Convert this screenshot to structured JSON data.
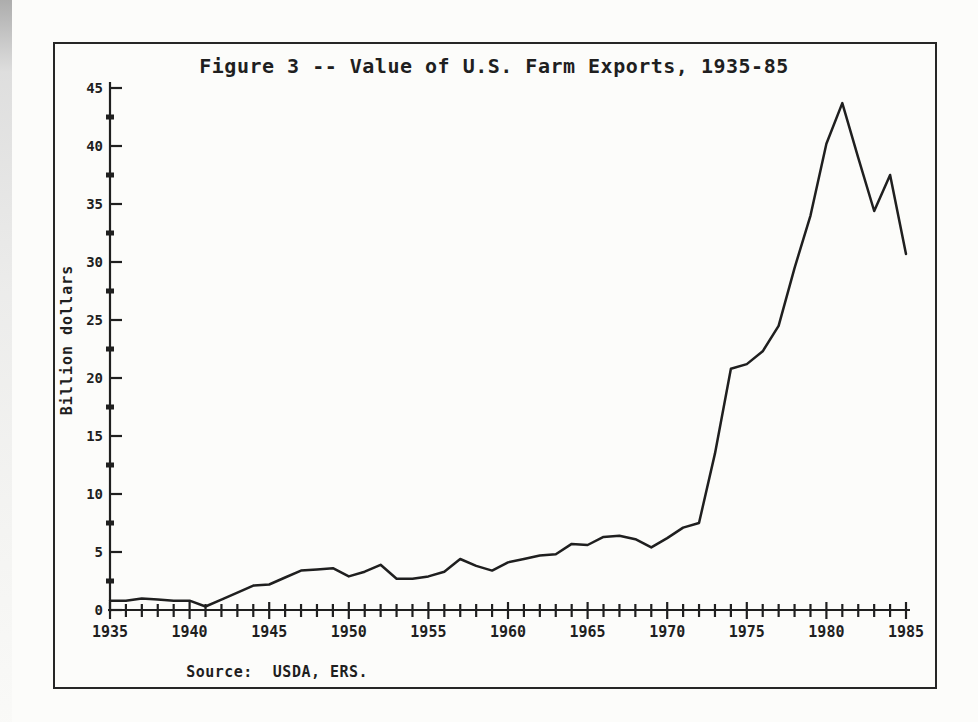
{
  "figure": {
    "title": "Figure 3 -- Value of U.S. Farm Exports, 1935-85",
    "y_axis_label": "Billion dollars",
    "source": {
      "label": "Source:",
      "value": "USDA, ERS."
    },
    "ink_color": "#1f1f1f",
    "paper_color": "#fcfcfa",
    "border_color": "#262626"
  },
  "chart_data": {
    "type": "line",
    "title": "Figure 3 -- Value of U.S. Farm Exports, 1935-85",
    "xlabel": "",
    "ylabel": "Billion dollars",
    "source_note": "Source: USDA, ERS.",
    "xlim": [
      1935,
      1985
    ],
    "ylim": [
      0,
      45
    ],
    "grid": false,
    "legend": "none",
    "x_axis": {
      "labeled_ticks": [
        1935,
        1940,
        1945,
        1950,
        1955,
        1960,
        1965,
        1970,
        1975,
        1980,
        1985
      ],
      "minor_tick_step_years": 1
    },
    "y_axis": {
      "major_ticks": [
        0,
        5,
        10,
        15,
        20,
        25,
        30,
        35,
        40,
        45
      ],
      "minor_tick_step": 2.5
    },
    "x": [
      1935,
      1936,
      1937,
      1938,
      1939,
      1940,
      1941,
      1942,
      1943,
      1944,
      1945,
      1946,
      1947,
      1948,
      1949,
      1950,
      1951,
      1952,
      1953,
      1954,
      1955,
      1956,
      1957,
      1958,
      1959,
      1960,
      1961,
      1962,
      1963,
      1964,
      1965,
      1966,
      1967,
      1968,
      1969,
      1970,
      1971,
      1972,
      1973,
      1974,
      1975,
      1976,
      1977,
      1978,
      1979,
      1980,
      1981,
      1982,
      1983,
      1984,
      1985
    ],
    "series": [
      {
        "name": "U.S. farm exports (billion dollars)",
        "values": [
          0.8,
          0.8,
          1.0,
          0.9,
          0.8,
          0.8,
          0.3,
          0.9,
          1.5,
          2.1,
          2.2,
          2.8,
          3.4,
          3.5,
          3.6,
          2.9,
          3.3,
          3.9,
          2.7,
          2.7,
          2.9,
          3.3,
          4.4,
          3.8,
          3.4,
          4.1,
          4.4,
          4.7,
          4.8,
          5.7,
          5.6,
          6.3,
          6.4,
          6.1,
          5.4,
          6.2,
          7.1,
          7.5,
          13.5,
          20.8,
          21.2,
          22.3,
          24.5,
          29.5,
          34.0,
          40.2,
          43.7,
          39.0,
          34.4,
          37.5,
          30.7
        ]
      }
    ]
  }
}
